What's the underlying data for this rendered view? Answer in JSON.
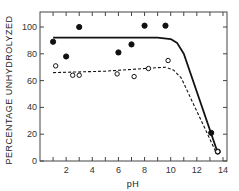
{
  "chart_data": {
    "type": "scatter",
    "title": "",
    "xlabel": "pH",
    "ylabel": "PERCENTAGE UNHYDROLYZED",
    "xlim": [
      0,
      14
    ],
    "ylim": [
      0,
      110
    ],
    "x_ticks": [
      2,
      4,
      6,
      8,
      10,
      12,
      14
    ],
    "x_tick_labels": [
      "2",
      "4",
      "6",
      "8",
      "10",
      "12",
      "14"
    ],
    "y_ticks": [
      0,
      20,
      40,
      60,
      80,
      100
    ],
    "y_tick_labels": [
      "0",
      "20",
      "40",
      "60",
      "80",
      "100"
    ],
    "grid": false,
    "legend": null,
    "series": [
      {
        "name": "filled circles",
        "marker": "filled-circle",
        "x": [
          1,
          2,
          3,
          6,
          7,
          8,
          9.6,
          13.1,
          13.6
        ],
        "y": [
          89,
          78,
          100,
          81,
          87,
          101,
          101,
          21,
          7
        ]
      },
      {
        "name": "open circles",
        "marker": "open-circle",
        "x": [
          1.2,
          2.5,
          3,
          5.9,
          7.2,
          8.3,
          9.8,
          13.6
        ],
        "y": [
          71,
          64,
          64,
          65,
          63,
          69,
          75,
          7
        ]
      },
      {
        "name": "solid fit curve",
        "line": "solid",
        "x": [
          1,
          9,
          10,
          10.5,
          11,
          13.6
        ],
        "y": [
          92,
          92,
          91,
          88,
          80,
          6
        ]
      },
      {
        "name": "dashed fit curve",
        "line": "dashed",
        "x": [
          1,
          5,
          8,
          9.6,
          10.2,
          10.8,
          13.5
        ],
        "y": [
          66,
          67,
          69,
          70,
          68,
          62,
          6
        ]
      }
    ]
  }
}
